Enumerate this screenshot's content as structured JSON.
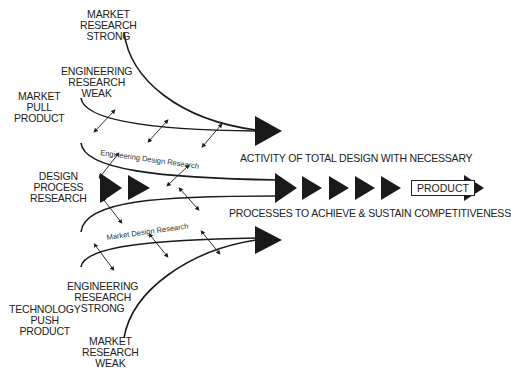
{
  "labels": {
    "market_research_strong": [
      "MARKET",
      "RESEARCH",
      "STRONG"
    ],
    "engineering_research_weak": [
      "ENGINEERING",
      "RESEARCH",
      "WEAK"
    ],
    "market_pull_product": [
      "MARKET",
      "PULL",
      "PRODUCT"
    ],
    "design_process_research": [
      "DESIGN",
      "PROCESS",
      "RESEARCH"
    ],
    "engineering_research_strong": [
      "ENGINEERING",
      "RESEARCH",
      "STRONG"
    ],
    "technology_push_product": [
      "TECHNOLOGY",
      "PUSH",
      "PRODUCT"
    ],
    "market_research_weak": [
      "MARKET",
      "RESEARCH",
      "WEAK"
    ]
  },
  "band_labels": {
    "engineering_design_research": "Engineering Design Research",
    "market_design_research": "Market Design Research"
  },
  "captions": {
    "line1": "ACTIVITY OF TOTAL DESIGN WITH NECESSARY",
    "line2": "PROCESSES TO ACHIEVE & SUSTAIN COMPETITIVENESS"
  },
  "product_label": "PRODUCT",
  "colors": {
    "ink": "#1a1a1a",
    "background": "#ffffff"
  }
}
